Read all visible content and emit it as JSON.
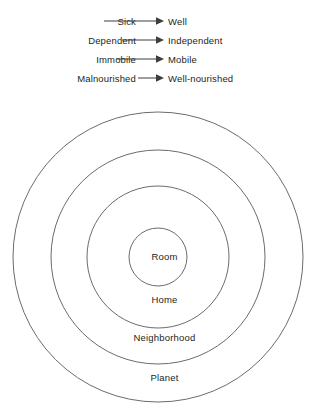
{
  "figure": {
    "stroke_color": "#5a5a5a",
    "text_color": "#231f20",
    "background": "#ffffff"
  },
  "transitions": {
    "arrow_icon": "right-arrow-icon",
    "rows": [
      {
        "from": "Sick",
        "to": "Well"
      },
      {
        "from": "Dependent",
        "to": "Independent"
      },
      {
        "from": "Immobile",
        "to": "Mobile"
      },
      {
        "from": "Malnourished",
        "to": "Well-nourished"
      }
    ]
  },
  "diagram_data": {
    "type": "concentric-circles",
    "center": {
      "x": 158,
      "y": 257
    },
    "rings": [
      {
        "label": "Planet",
        "radius": 145,
        "label_y": 378
      },
      {
        "label": "Neighborhood",
        "radius": 107,
        "label_y": 338
      },
      {
        "label": "Home",
        "radius": 71,
        "label_y": 300
      },
      {
        "label": "Room",
        "radius": 29,
        "label_y": 257
      }
    ]
  }
}
